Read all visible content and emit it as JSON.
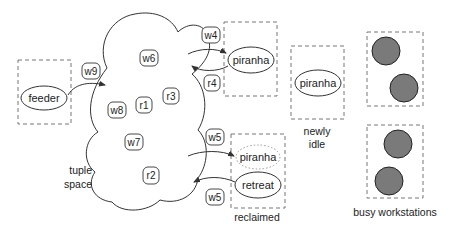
{
  "diagram": {
    "cloud_label": [
      "tuple",
      "space"
    ],
    "tuples": [
      {
        "id": "w6",
        "label": "w6"
      },
      {
        "id": "w8",
        "label": "w8"
      },
      {
        "id": "r1",
        "label": "r1"
      },
      {
        "id": "r3",
        "label": "r3"
      },
      {
        "id": "w7",
        "label": "w7"
      },
      {
        "id": "r2",
        "label": "r2"
      }
    ],
    "feeder": {
      "label": "feeder",
      "arrow_tag": "w9"
    },
    "active_piranha": {
      "label": "piranha",
      "out_tag": "w4",
      "in_tag": "r4"
    },
    "newly_idle": {
      "node_label": "piranha",
      "caption": [
        "newly",
        "idle"
      ]
    },
    "reclaimed": {
      "piranha_label": "piranha",
      "retreat_label": "retreat",
      "caption": "reclaimed",
      "in_tag": "w5",
      "out_tag": "w5"
    },
    "busy_workstations": {
      "caption": "busy workstations",
      "count_top_box": 2,
      "count_bottom_box": 2
    },
    "colors": {
      "busy_fill": "#7a7a7a",
      "line": "#333333",
      "dashed_box": "#777777"
    }
  }
}
